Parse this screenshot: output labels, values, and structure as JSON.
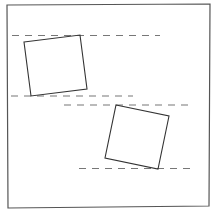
{
  "diagram": {
    "shapes": [
      {
        "name": "square-upper-left",
        "kind": "square",
        "rotation_direction": "counter-clockwise",
        "bounded_by": [
          "guide-line-1",
          "guide-line-2"
        ]
      },
      {
        "name": "square-lower-right",
        "kind": "square",
        "rotation_direction": "clockwise",
        "bounded_by": [
          "guide-line-3",
          "guide-line-4"
        ]
      }
    ],
    "guides": [
      {
        "name": "guide-line-1",
        "style": "dashed"
      },
      {
        "name": "guide-line-2",
        "style": "dashed"
      },
      {
        "name": "guide-line-3",
        "style": "dashed"
      },
      {
        "name": "guide-line-4",
        "style": "dashed"
      }
    ],
    "colors": {
      "frame": "#555555",
      "square": "#333333",
      "guide": "#777777",
      "background": "#ffffff"
    }
  }
}
